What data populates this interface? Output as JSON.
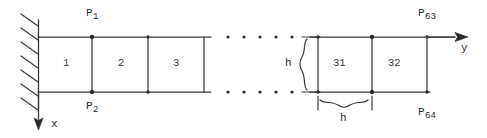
{
  "figure": {
    "ink_color": "#2b2b2b",
    "background_color": "#ffffff"
  },
  "nodes": [
    {
      "name": "P-1",
      "base": "P",
      "sub": "1",
      "x": 86,
      "y": 8,
      "dot_x": 92,
      "dot_y": 37
    },
    {
      "name": "P-2",
      "base": "P",
      "sub": "2",
      "x": 86,
      "y": 101,
      "dot_x": 92,
      "dot_y": 92
    },
    {
      "name": "P-63",
      "base": "P",
      "sub": "63",
      "x": 418,
      "y": 8,
      "dot_x": 372,
      "dot_y": 37
    },
    {
      "name": "P-64",
      "base": "P",
      "sub": "64",
      "x": 418,
      "y": 107,
      "dot_x": 372,
      "dot_y": 92
    }
  ],
  "elements": [
    {
      "label": "1",
      "x": 66,
      "y": 58
    },
    {
      "label": "2",
      "x": 121,
      "y": 58
    },
    {
      "label": "3",
      "x": 176,
      "y": 58
    },
    {
      "label": "31",
      "x": 338,
      "y": 58
    },
    {
      "label": "32",
      "x": 393,
      "y": 58
    }
  ],
  "dimensions": [
    {
      "name": "h-vertical",
      "label": "h",
      "x": 286,
      "y": 58
    },
    {
      "name": "h-horizontal",
      "label": "h",
      "x": 341,
      "y": 113
    }
  ],
  "axes": [
    {
      "name": "x-axis",
      "label": "x",
      "x": 50,
      "y": 120,
      "direction": "down"
    },
    {
      "name": "y-axis",
      "label": "y",
      "x": 461,
      "y": 44,
      "direction": "right"
    }
  ],
  "ellipsis": {
    "top_row_y": 37,
    "bottom_row_y": 92,
    "dot_count": 5,
    "x_positions": [
      228,
      244,
      260,
      276,
      292
    ]
  },
  "geometry": {
    "wall_x": 38,
    "top_beam_y": 37,
    "bottom_beam_y": 92,
    "left_section_end_x": 210,
    "right_section_start_x": 318,
    "left_verticals_x": [
      92,
      148,
      204
    ],
    "right_verticals_x": [
      318,
      372,
      427
    ],
    "hatch_count": 7
  }
}
